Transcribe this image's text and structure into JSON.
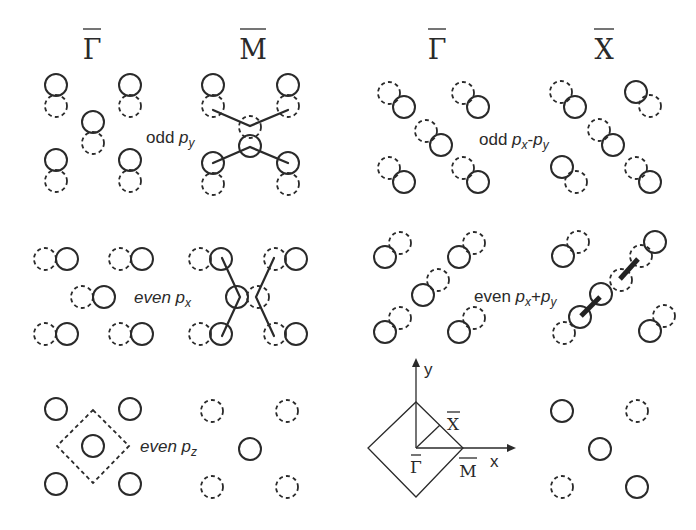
{
  "headers": {
    "left_gamma": "Γ",
    "left_m": "M",
    "right_gamma": "Γ",
    "right_x": "X"
  },
  "panels": [
    {
      "id": "odd-py",
      "pre": "odd ",
      "orbital": "p",
      "sub": "y",
      "mid": "",
      "orbital2": "",
      "sub2": "",
      "italic_pre": false
    },
    {
      "id": "odd-px-py",
      "pre": "odd ",
      "orbital": "p",
      "sub": "x",
      "mid": "-",
      "orbital2": "p",
      "sub2": "y",
      "italic_pre": false
    },
    {
      "id": "even-px",
      "pre": "even ",
      "orbital": "p",
      "sub": "x",
      "mid": "",
      "orbital2": "",
      "sub2": "",
      "italic_pre": true
    },
    {
      "id": "even-px-plus-py",
      "pre": "even ",
      "orbital": "p",
      "sub": "x",
      "mid": "+",
      "orbital2": "p",
      "sub2": "y",
      "italic_pre": false
    },
    {
      "id": "even-pz",
      "pre": "even ",
      "orbital": "p",
      "sub": "z",
      "mid": "",
      "orbital2": "",
      "sub2": "",
      "italic_pre": true
    }
  ],
  "brillouin_zone": {
    "axis_x": "x",
    "axis_y": "y",
    "gamma": "Γ",
    "x_point": "X",
    "m_point": "M"
  },
  "legend_semantics": {
    "solid_circle": "orbital lobe (positive/occupied phase)",
    "dashed_circle": "orbital lobe (opposite phase)"
  }
}
